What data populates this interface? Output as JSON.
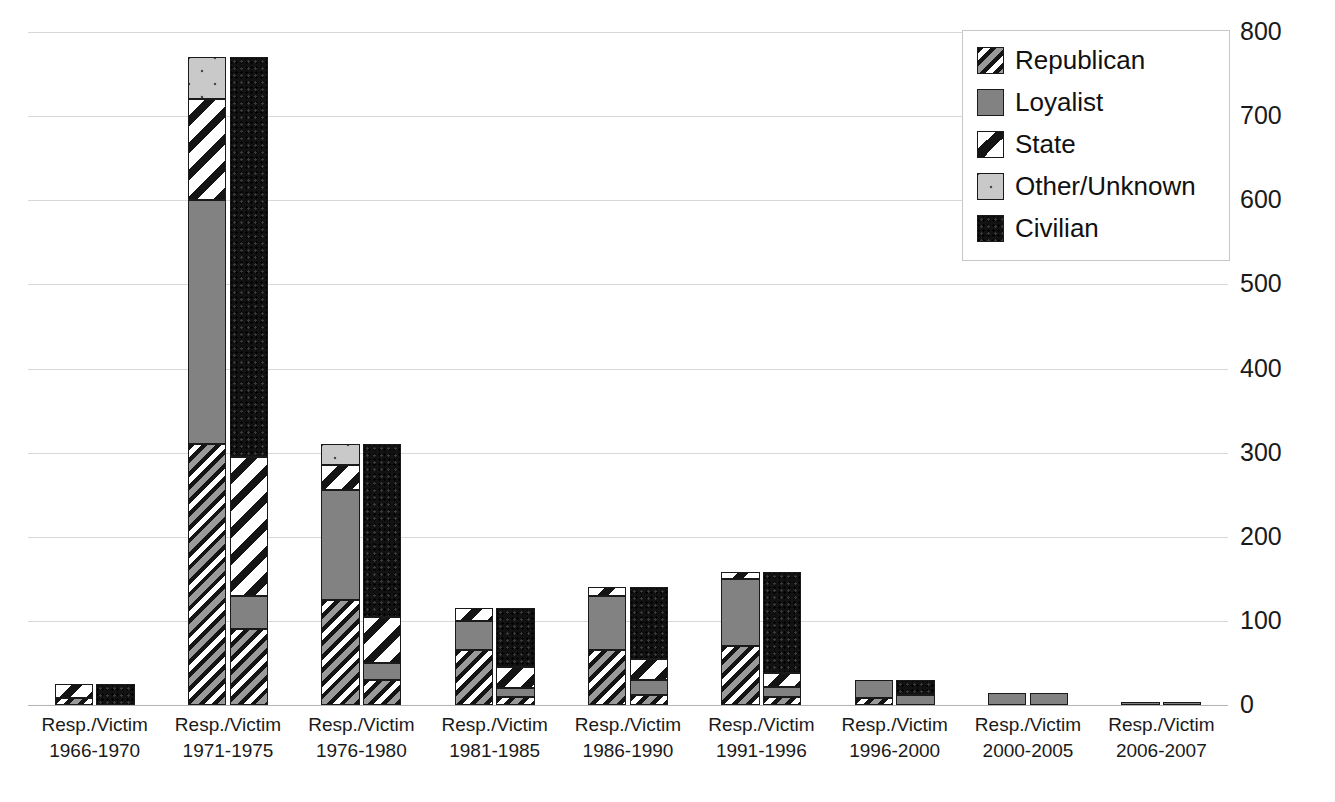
{
  "chart_data": {
    "type": "bar",
    "title": "",
    "subtitle": "",
    "xlabel": "",
    "ylabel": "",
    "ylim": [
      0,
      800
    ],
    "ytick_step": 100,
    "yticks": [
      "0",
      "100",
      "200",
      "300",
      "400",
      "500",
      "600",
      "700",
      "800"
    ],
    "grid": true,
    "stacked": true,
    "legend_position": "top-right",
    "legend": [
      "Republican",
      "Loyalist",
      "State",
      "Other/Unknown",
      "Civilian"
    ],
    "series_colors": {
      "Republican": "#6e6e6e",
      "Loyalist": "#828282",
      "State": "#ffffff",
      "Other/Unknown": "#c9c9c9",
      "Civilian": "#121212"
    },
    "bar_pair_labels": [
      "Resp.",
      "Victim"
    ],
    "categories": [
      "Resp./Victim 1966-1970",
      "Resp./Victim 1971-1975",
      "Resp./Victim 1976-1980",
      "Resp./Victim 1981-1985",
      "Resp./Victim 1986-1990",
      "Resp./Victim 1991-1996",
      "Resp./Victim 1996-2000",
      "Resp./Victim 2000-2005",
      "Resp./Victim 2006-2007"
    ],
    "groups": [
      {
        "period": "1966-1970",
        "responsibility": {
          "Republican": 8,
          "Loyalist": 0,
          "State": 17,
          "Other/Unknown": 0,
          "Civilian": 0,
          "total": 25
        },
        "victim": {
          "Republican": 0,
          "Loyalist": 0,
          "State": 0,
          "Other/Unknown": 0,
          "Civilian": 25,
          "total": 25
        }
      },
      {
        "period": "1971-1975",
        "responsibility": {
          "Republican": 310,
          "Loyalist": 290,
          "State": 120,
          "Other/Unknown": 50,
          "Civilian": 0,
          "total": 770
        },
        "victim": {
          "Republican": 90,
          "Loyalist": 40,
          "State": 165,
          "Other/Unknown": 0,
          "Civilian": 475,
          "total": 770
        }
      },
      {
        "period": "1976-1980",
        "responsibility": {
          "Republican": 125,
          "Loyalist": 130,
          "State": 30,
          "Other/Unknown": 25,
          "Civilian": 0,
          "total": 310
        },
        "victim": {
          "Republican": 30,
          "Loyalist": 20,
          "State": 55,
          "Other/Unknown": 0,
          "Civilian": 205,
          "total": 310
        }
      },
      {
        "period": "1981-1985",
        "responsibility": {
          "Republican": 65,
          "Loyalist": 35,
          "State": 15,
          "Other/Unknown": 0,
          "Civilian": 0,
          "total": 115
        },
        "victim": {
          "Republican": 10,
          "Loyalist": 10,
          "State": 25,
          "Other/Unknown": 0,
          "Civilian": 70,
          "total": 115
        }
      },
      {
        "period": "1986-1990",
        "responsibility": {
          "Republican": 65,
          "Loyalist": 65,
          "State": 10,
          "Other/Unknown": 0,
          "Civilian": 0,
          "total": 140
        },
        "victim": {
          "Republican": 12,
          "Loyalist": 18,
          "State": 25,
          "Other/Unknown": 0,
          "Civilian": 85,
          "total": 140
        }
      },
      {
        "period": "1991-1996",
        "responsibility": {
          "Republican": 70,
          "Loyalist": 80,
          "State": 8,
          "Other/Unknown": 0,
          "Civilian": 0,
          "total": 158
        },
        "victim": {
          "Republican": 10,
          "Loyalist": 12,
          "State": 16,
          "Other/Unknown": 0,
          "Civilian": 120,
          "total": 158
        }
      },
      {
        "period": "1996-2000",
        "responsibility": {
          "Republican": 8,
          "Loyalist": 22,
          "State": 0,
          "Other/Unknown": 0,
          "Civilian": 0,
          "total": 30
        },
        "victim": {
          "Republican": 0,
          "Loyalist": 12,
          "State": 0,
          "Other/Unknown": 0,
          "Civilian": 18,
          "total": 30
        }
      },
      {
        "period": "2000-2005",
        "responsibility": {
          "Republican": 0,
          "Loyalist": 14,
          "State": 0,
          "Other/Unknown": 0,
          "Civilian": 0,
          "total": 14
        },
        "victim": {
          "Republican": 0,
          "Loyalist": 14,
          "State": 0,
          "Other/Unknown": 0,
          "Civilian": 0,
          "total": 14
        }
      },
      {
        "period": "2006-2007",
        "responsibility": {
          "Republican": 0,
          "Loyalist": 2,
          "State": 0,
          "Other/Unknown": 0,
          "Civilian": 0,
          "total": 2
        },
        "victim": {
          "Republican": 0,
          "Loyalist": 2,
          "State": 0,
          "Other/Unknown": 0,
          "Civilian": 0,
          "total": 2
        }
      }
    ]
  },
  "x_labels": [
    {
      "line1": "Resp./Victim",
      "line2": "1966-1970"
    },
    {
      "line1": "Resp./Victim",
      "line2": "1971-1975"
    },
    {
      "line1": "Resp./Victim",
      "line2": "1976-1980"
    },
    {
      "line1": "Resp./Victim",
      "line2": "1981-1985"
    },
    {
      "line1": "Resp./Victim",
      "line2": "1986-1990"
    },
    {
      "line1": "Resp./Victim",
      "line2": "1991-1996"
    },
    {
      "line1": "Resp./Victim",
      "line2": "1996-2000"
    },
    {
      "line1": "Resp./Victim",
      "line2": "2000-2005"
    },
    {
      "line1": "Resp./Victim",
      "line2": "2006-2007"
    }
  ],
  "legend": {
    "items": [
      {
        "label": "Republican",
        "icon": "hatched-swatch-icon",
        "fill_class": "fill-republican"
      },
      {
        "label": "Loyalist",
        "icon": "solid-gray-swatch-icon",
        "fill_class": "fill-loyalist"
      },
      {
        "label": "State",
        "icon": "diagonal-swatch-icon",
        "fill_class": "fill-state"
      },
      {
        "label": "Other/Unknown",
        "icon": "light-gray-swatch-icon",
        "fill_class": "fill-other"
      },
      {
        "label": "Civilian",
        "icon": "solid-black-swatch-icon",
        "fill_class": "fill-civilian"
      }
    ]
  }
}
